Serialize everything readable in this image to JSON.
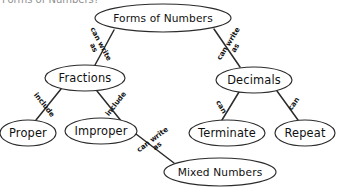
{
  "document": {
    "title": "Forms of Numbers",
    "clipped_heading": "Forms of Numbers?"
  },
  "chart_data": {
    "type": "diagram",
    "title": "Forms of Numbers",
    "nodes": [
      {
        "id": "forms",
        "label": "Forms of Numbers",
        "cx": 163,
        "cy": 18,
        "rx": 68,
        "ry": 14
      },
      {
        "id": "fractions",
        "label": "Fractions",
        "cx": 85,
        "cy": 78,
        "rx": 40,
        "ry": 13
      },
      {
        "id": "decimals",
        "label": "Decimals",
        "cx": 254,
        "cy": 80,
        "rx": 38,
        "ry": 13
      },
      {
        "id": "proper",
        "label": "Proper",
        "cx": 28,
        "cy": 133,
        "rx": 28,
        "ry": 13
      },
      {
        "id": "improper",
        "label": "Improper",
        "cx": 101,
        "cy": 131,
        "rx": 36,
        "ry": 13
      },
      {
        "id": "terminate",
        "label": "Terminate",
        "cx": 227,
        "cy": 133,
        "rx": 38,
        "ry": 13
      },
      {
        "id": "repeat",
        "label": "Repeat",
        "cx": 305,
        "cy": 133,
        "rx": 30,
        "ry": 13
      },
      {
        "id": "mixed",
        "label": "Mixed Numbers",
        "cx": 220,
        "cy": 172,
        "rx": 56,
        "ry": 14
      }
    ],
    "edges": [
      {
        "from": "forms",
        "to": "fractions",
        "label": "can write as",
        "x1": 114,
        "y1": 30,
        "x2": 95,
        "y2": 65,
        "lx": 97,
        "ly": 46,
        "rot": 62
      },
      {
        "from": "forms",
        "to": "decimals",
        "label": "can write as",
        "x1": 214,
        "y1": 29,
        "x2": 240,
        "y2": 67,
        "lx": 232,
        "ly": 46,
        "rot": -58
      },
      {
        "from": "fractions",
        "to": "proper",
        "label": "include",
        "x1": 61,
        "y1": 89,
        "x2": 36,
        "y2": 120,
        "lx": 44,
        "ly": 105,
        "rot": 52
      },
      {
        "from": "fractions",
        "to": "improper",
        "label": "include",
        "x1": 97,
        "y1": 91,
        "x2": 122,
        "y2": 122,
        "lx": 116,
        "ly": 104,
        "rot": -52
      },
      {
        "from": "improper",
        "to": "mixed",
        "label": "can write as",
        "x1": 136,
        "y1": 134,
        "x2": 174,
        "y2": 163,
        "lx": 155,
        "ly": 143,
        "rot": -37
      },
      {
        "from": "decimals",
        "to": "terminate",
        "label": "can",
        "x1": 239,
        "y1": 92,
        "x2": 222,
        "y2": 120,
        "lx": 221,
        "ly": 107,
        "rot": 59
      },
      {
        "from": "decimals",
        "to": "repeat",
        "label": "can",
        "x1": 277,
        "y1": 91,
        "x2": 298,
        "y2": 120,
        "lx": 294,
        "ly": 104,
        "rot": -55
      }
    ],
    "style": {
      "node_fill": "#ffffff",
      "node_stroke": "#2b2b2b",
      "edge_stroke": "#2b2b2b",
      "text_color": "#101010",
      "background": "#ffffff"
    }
  }
}
